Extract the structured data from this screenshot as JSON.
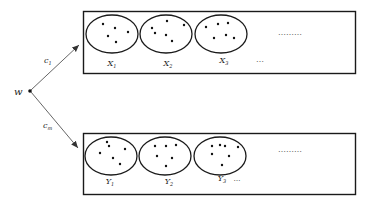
{
  "diagram": {
    "source_node": {
      "label": "w"
    },
    "edges": [
      {
        "label": "c",
        "subscript": "1",
        "target": "top-box"
      },
      {
        "label": "c",
        "subscript": "m",
        "target": "bottom-box"
      }
    ],
    "top_box": {
      "sets": [
        {
          "label": "X",
          "subscript": "1"
        },
        {
          "label": "X",
          "subscript": "2"
        },
        {
          "label": "X",
          "subscript": "3"
        }
      ],
      "dots_label": "………",
      "ellipsis_label": "…"
    },
    "bottom_box": {
      "sets": [
        {
          "label": "Y",
          "subscript": "1"
        },
        {
          "label": "Y",
          "subscript": "2"
        },
        {
          "label": "Y",
          "subscript": "3"
        }
      ],
      "dots_label": "………",
      "ellipsis_label": "…"
    },
    "colors": {
      "stroke": "#1a1a1a",
      "arrow": "#555555",
      "background": "#ffffff"
    }
  }
}
